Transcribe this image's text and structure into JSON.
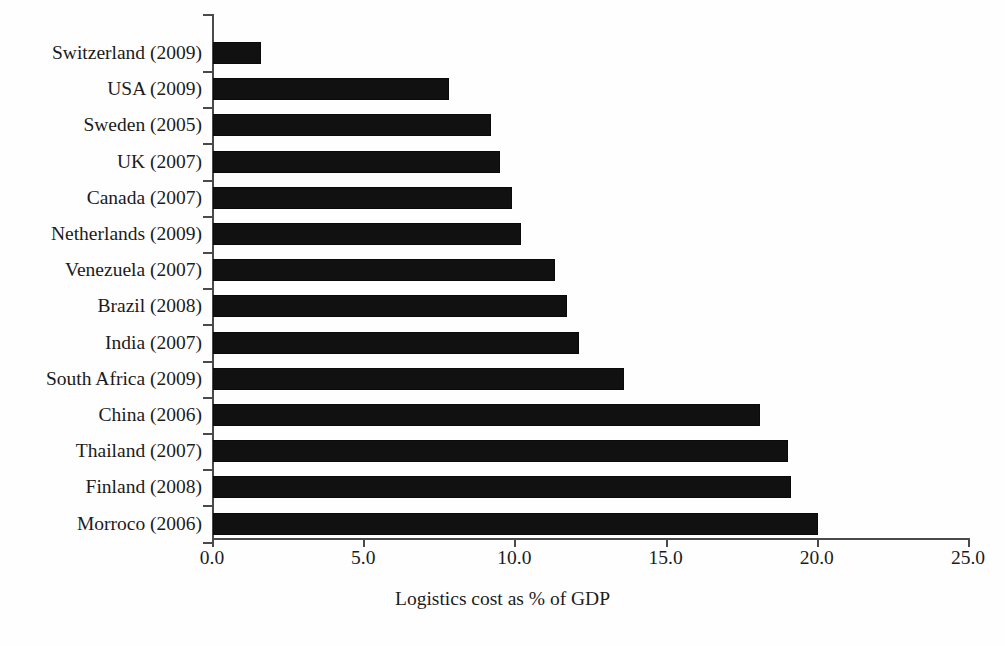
{
  "chart_data": {
    "type": "bar",
    "orientation": "horizontal",
    "title": "",
    "xlabel": "Logistics cost as % of GDP",
    "ylabel": "",
    "xlim": [
      0.0,
      25.0
    ],
    "xticks": [
      "0.0",
      "5.0",
      "10.0",
      "15.0",
      "20.0",
      "25.0"
    ],
    "xtick_values": [
      0,
      5,
      10,
      15,
      20,
      25
    ],
    "grid": false,
    "legend": null,
    "bar_color": "#111111",
    "axis_color": "#4a4a4a",
    "categories": [
      "Switzerland (2009)",
      "USA (2009)",
      "Sweden (2005)",
      "UK (2007)",
      "Canada (2007)",
      "Netherlands (2009)",
      "Venezuela (2007)",
      "Brazil (2008)",
      "India (2007)",
      "South Africa (2009)",
      "China (2006)",
      "Thailand (2007)",
      "Finland (2008)",
      "Morroco (2006)"
    ],
    "values": [
      1.6,
      7.8,
      9.2,
      9.5,
      9.9,
      10.2,
      11.3,
      11.7,
      12.1,
      13.6,
      18.1,
      19.0,
      19.1,
      20.0
    ]
  },
  "ghost_text": "scanned page bleed-through"
}
